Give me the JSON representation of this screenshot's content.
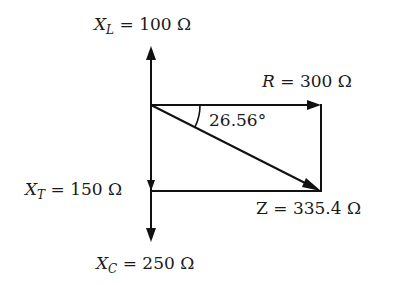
{
  "diagram": {
    "type": "impedance-phasor-diagram",
    "labels": {
      "xl": {
        "symbol": "X",
        "subscript": "L",
        "equals": " = ",
        "value": "100 Ω"
      },
      "r": {
        "symbol": "R",
        "equals": " = ",
        "value": "300 Ω"
      },
      "angle": {
        "value": "26.56°"
      },
      "xt": {
        "symbol": "X",
        "subscript": "T",
        "equals": " = ",
        "value": "150 Ω"
      },
      "z": {
        "symbol": "Z",
        "equals": " = ",
        "value": "335.4 Ω"
      },
      "xc": {
        "symbol": "X",
        "subscript": "C",
        "equals": " = ",
        "value": "250 Ω"
      }
    },
    "colors": {
      "stroke": "#111111",
      "text": "#1a1a1a",
      "background": "#ffffff"
    }
  }
}
